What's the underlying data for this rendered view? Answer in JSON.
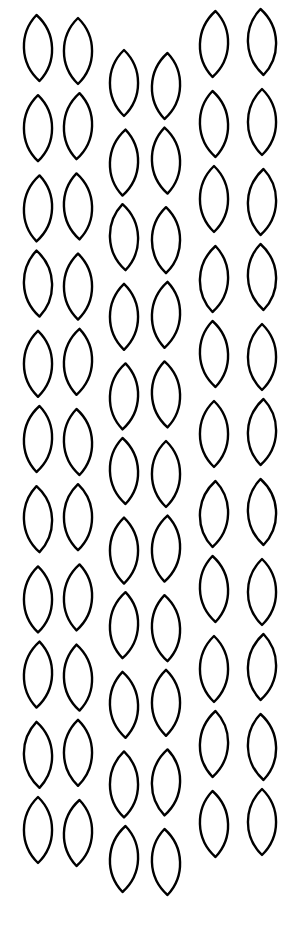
{
  "pattern": {
    "type": "leaf-outline-pattern",
    "background": "#ffffff",
    "stroke": "#000000",
    "leaf_width": 30,
    "leaf_height": 66,
    "columns": [
      {
        "group": "left",
        "xs": [
          38,
          78
        ],
        "y_start": 50,
        "y_step": 78.2,
        "count": 11
      },
      {
        "group": "middle",
        "xs": [
          124,
          166
        ],
        "y_start": 84,
        "y_step": 77.6,
        "count": 11
      },
      {
        "group": "right",
        "xs": [
          214,
          262
        ],
        "y_start": 44,
        "y_step": 78.0,
        "count": 11
      }
    ]
  }
}
